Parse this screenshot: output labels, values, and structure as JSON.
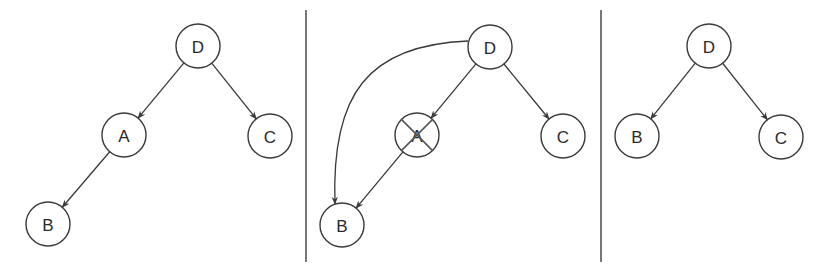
{
  "colors": {
    "stroke": "#3a3a3a",
    "divider": "#555555",
    "background": "#ffffff"
  },
  "panels": [
    {
      "name": "before",
      "nodes": [
        {
          "id": "D",
          "label": "D",
          "x": 198,
          "y": 46
        },
        {
          "id": "A",
          "label": "A",
          "x": 124,
          "y": 135
        },
        {
          "id": "C",
          "label": "C",
          "x": 270,
          "y": 136
        },
        {
          "id": "B",
          "label": "B",
          "x": 48,
          "y": 224
        }
      ],
      "edges": [
        {
          "from": "D",
          "to": "A"
        },
        {
          "from": "D",
          "to": "C"
        },
        {
          "from": "A",
          "to": "B"
        }
      ]
    },
    {
      "name": "during",
      "nodes": [
        {
          "id": "D",
          "label": "D",
          "x": 490,
          "y": 47
        },
        {
          "id": "A",
          "label": "A",
          "x": 417,
          "y": 135,
          "crossed_out": true
        },
        {
          "id": "C",
          "label": "C",
          "x": 563,
          "y": 136
        },
        {
          "id": "B",
          "label": "B",
          "x": 342,
          "y": 225
        }
      ],
      "edges": [
        {
          "from": "D",
          "to": "A"
        },
        {
          "from": "D",
          "to": "C"
        },
        {
          "from": "A",
          "to": "B"
        },
        {
          "from": "D",
          "to": "B",
          "curved": true
        }
      ]
    },
    {
      "name": "after",
      "nodes": [
        {
          "id": "D",
          "label": "D",
          "x": 709,
          "y": 46
        },
        {
          "id": "B",
          "label": "B",
          "x": 637,
          "y": 136
        },
        {
          "id": "C",
          "label": "C",
          "x": 781,
          "y": 137
        }
      ],
      "edges": [
        {
          "from": "D",
          "to": "B"
        },
        {
          "from": "D",
          "to": "C"
        }
      ]
    }
  ],
  "dividers": [
    {
      "x": 306,
      "y1": 10,
      "y2": 262
    },
    {
      "x": 601,
      "y1": 10,
      "y2": 262
    }
  ]
}
